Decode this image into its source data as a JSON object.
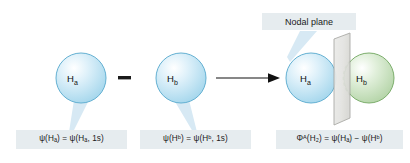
{
  "figure": {
    "title_text": "Antibonding molecular orbital formation from 1s atomic orbitals",
    "background_color": "#ffffff",
    "label_box_color": "#e6ecef",
    "text_color": "#1a1a1a"
  },
  "operators": {
    "minus_sign": "−",
    "arrow": "→"
  },
  "orbitals": [
    {
      "id": "left-blue",
      "atom_label_main": "H",
      "atom_label_sub": "a",
      "phase_color": "#bfe3f2",
      "stroke_color": "#5aa9cc",
      "cx": 81,
      "cy": 78,
      "r": 25
    },
    {
      "id": "middle-blue",
      "atom_label_main": "H",
      "atom_label_sub": "b",
      "phase_color": "#bfe3f2",
      "stroke_color": "#5aa9cc",
      "cx": 181,
      "cy": 78,
      "r": 25
    },
    {
      "id": "product-left-blue",
      "atom_label_main": "H",
      "atom_label_sub": "a",
      "phase_color": "#bfe3f2",
      "stroke_color": "#5aa9cc",
      "cx": 311,
      "cy": 78,
      "r": 25
    },
    {
      "id": "product-right-green",
      "atom_label_main": "H",
      "atom_label_sub": "b",
      "phase_color": "#cfe5c8",
      "stroke_color": "#6fa35f",
      "cx": 369,
      "cy": 78,
      "r": 25
    }
  ],
  "nodal_plane": {
    "label": "Nodal plane",
    "fill_color": "#e3e3e1",
    "stroke_color": "#9a9a96"
  },
  "equations": {
    "left": "ψ(Hₐ) = ψ(Hₐ, 1s)",
    "middle": "ψ(Hᵇ) = ψ(Hᵇ, 1s)",
    "product": "Φᴬ(H₂) = ψ(Hₐ) − ψ(Hᵇ)"
  },
  "leaders": {
    "color": "#d3e6f2"
  }
}
